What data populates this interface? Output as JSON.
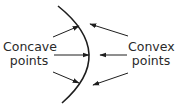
{
  "diagram": {
    "title": "",
    "colors": {
      "stroke": "#1e1e1e",
      "text": "#2a2a2a",
      "background": "#ffffff"
    },
    "curve": {
      "description": "curved boundary bulging to the right"
    },
    "labels": {
      "concave": {
        "line1": "Concave",
        "line2": "points"
      },
      "convex": {
        "line1": "Convex",
        "line2": "points"
      }
    },
    "arrows": {
      "concave_side": [
        {
          "from": [
            53,
            37
          ],
          "to": [
            79,
            26
          ]
        },
        {
          "from": [
            54,
            55
          ],
          "to": [
            89,
            55
          ]
        },
        {
          "from": [
            53,
            72
          ],
          "to": [
            79,
            83
          ]
        }
      ],
      "convex_side": [
        {
          "from": [
            128,
            36
          ],
          "to": [
            90,
            24
          ]
        },
        {
          "from": [
            127,
            55
          ],
          "to": [
            100,
            55
          ]
        },
        {
          "from": [
            128,
            73
          ],
          "to": [
            93,
            85
          ]
        }
      ]
    }
  }
}
